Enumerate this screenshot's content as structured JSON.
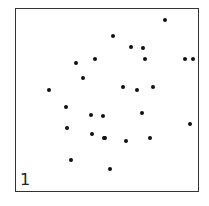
{
  "chart_data": {
    "type": "scatter",
    "title": "",
    "xlabel": "",
    "ylabel": "",
    "panel_label": "1",
    "grid": false,
    "axes_ticks": false,
    "xlim": [
      0,
      100
    ],
    "ylim": [
      0,
      100
    ],
    "points": [
      {
        "x": 81.5,
        "y": 93.5
      },
      {
        "x": 53.3,
        "y": 84.8
      },
      {
        "x": 63.0,
        "y": 78.8
      },
      {
        "x": 69.6,
        "y": 78.3
      },
      {
        "x": 43.5,
        "y": 72.3
      },
      {
        "x": 64.5,
        "y": 72.3
      },
      {
        "x": 32.6,
        "y": 70.1
      },
      {
        "x": 92.4,
        "y": 72.3
      },
      {
        "x": 96.7,
        "y": 72.3
      },
      {
        "x": 33.2,
        "y": 62.5
      },
      {
        "x": 18.5,
        "y": 56.0
      },
      {
        "x": 58.7,
        "y": 57.1
      },
      {
        "x": 66.3,
        "y": 55.4
      },
      {
        "x": 74.5,
        "y": 57.1
      },
      {
        "x": 27.7,
        "y": 46.7
      },
      {
        "x": 41.3,
        "y": 42.4
      },
      {
        "x": 47.8,
        "y": 41.8
      },
      {
        "x": 69.0,
        "y": 43.5
      },
      {
        "x": 28.3,
        "y": 34.8
      },
      {
        "x": 95.1,
        "y": 37.5
      },
      {
        "x": 41.8,
        "y": 31.5
      },
      {
        "x": 48.4,
        "y": 29.3
      },
      {
        "x": 48.9,
        "y": 29.3
      },
      {
        "x": 60.3,
        "y": 27.7
      },
      {
        "x": 73.4,
        "y": 29.3
      },
      {
        "x": 30.4,
        "y": 17.4
      },
      {
        "x": 51.6,
        "y": 12.5
      }
    ]
  },
  "dots_px": [
    {
      "x": 165,
      "y": 20
    },
    {
      "x": 113,
      "y": 36
    },
    {
      "x": 131,
      "y": 47
    },
    {
      "x": 143,
      "y": 48
    },
    {
      "x": 95,
      "y": 59
    },
    {
      "x": 145,
      "y": 59
    },
    {
      "x": 76,
      "y": 63
    },
    {
      "x": 185,
      "y": 59
    },
    {
      "x": 193,
      "y": 59
    },
    {
      "x": 83,
      "y": 78
    },
    {
      "x": 49,
      "y": 90
    },
    {
      "x": 123,
      "y": 87
    },
    {
      "x": 137,
      "y": 90
    },
    {
      "x": 153,
      "y": 87
    },
    {
      "x": 66,
      "y": 107
    },
    {
      "x": 91,
      "y": 115
    },
    {
      "x": 103,
      "y": 116
    },
    {
      "x": 142,
      "y": 113
    },
    {
      "x": 67,
      "y": 128
    },
    {
      "x": 190,
      "y": 124
    },
    {
      "x": 92,
      "y": 134
    },
    {
      "x": 104,
      "y": 138
    },
    {
      "x": 105,
      "y": 138
    },
    {
      "x": 126,
      "y": 141
    },
    {
      "x": 150,
      "y": 138
    },
    {
      "x": 71,
      "y": 160
    },
    {
      "x": 110,
      "y": 169
    }
  ]
}
